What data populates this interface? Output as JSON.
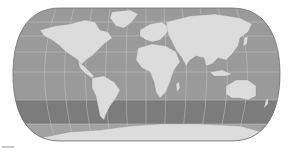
{
  "map": {
    "projection": "pseudocylindrical-world",
    "style": "grayscale",
    "colors": {
      "ocean": "#9a9a9a",
      "southern_band": "#7c7c7c",
      "polar_ocean": "#a8a8a8",
      "land": "#dcdcdc",
      "graticule": "#c9c9c9",
      "outline": "#6e6e6e",
      "background": "#ffffff"
    },
    "continents": [
      "North America",
      "South America",
      "Europe",
      "Africa",
      "Asia",
      "Australia",
      "Antarctica",
      "Greenland"
    ]
  }
}
